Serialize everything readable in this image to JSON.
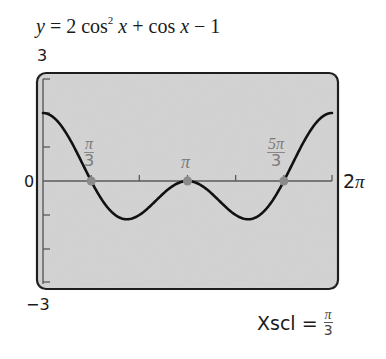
{
  "title": {
    "y": "y",
    "eq": " = 2 cos",
    "exp": "2",
    "x1": " x",
    "mid": " + cos ",
    "x2": "x",
    "tail": " − 1"
  },
  "window": {
    "ymax_label": "3",
    "ymin_label": "−3",
    "xmin_label": "0",
    "xmax_label_num": "2",
    "xmax_label_pi": "π",
    "xscl_label": "Xscl =",
    "xscl_num": "π",
    "xscl_den": "3"
  },
  "zero_labels": [
    {
      "num": "π",
      "den": "3"
    },
    {
      "text": "π"
    },
    {
      "num": "5π",
      "den": "3"
    }
  ],
  "colors": {
    "screen_bg": "#d4d4d4",
    "screen_border": "#1e1e1e",
    "curve": "#111111",
    "axis": "#5a5a5a",
    "point": "#8a8a8a",
    "label_gray": "#7a7a7a"
  },
  "chart_data": {
    "type": "line",
    "function": "2*cos(x)^2 + cos(x) - 1",
    "xlabel": "",
    "ylabel": "",
    "xlim": [
      0,
      6.2832
    ],
    "ylim": [
      -3,
      3
    ],
    "xscl": "π/3",
    "yscl": 1,
    "grid": false,
    "x_tick_labels": [
      "0",
      "2π"
    ],
    "y_tick_labels": [
      "3",
      "0",
      "−3"
    ],
    "annotations": [
      "π/3",
      "π",
      "5π/3",
      "Xscl = π/3"
    ],
    "highlighted_points": [
      {
        "label": "π/3",
        "x": 1.0472,
        "y": 0
      },
      {
        "label": "π",
        "x": 3.1416,
        "y": 0
      },
      {
        "label": "5π/3",
        "x": 5.236,
        "y": 0
      }
    ],
    "x": [
      0,
      0.5236,
      1.0472,
      1.5708,
      1.8235,
      2.0944,
      2.618,
      3.1416,
      3.6652,
      4.1888,
      4.4597,
      4.7124,
      5.236,
      5.7596,
      6.2832
    ],
    "values": [
      2,
      1.366,
      0,
      -1,
      -1.125,
      -1,
      -0.366,
      0,
      -0.366,
      -1,
      -1.125,
      -1,
      0,
      1.366,
      2
    ]
  }
}
